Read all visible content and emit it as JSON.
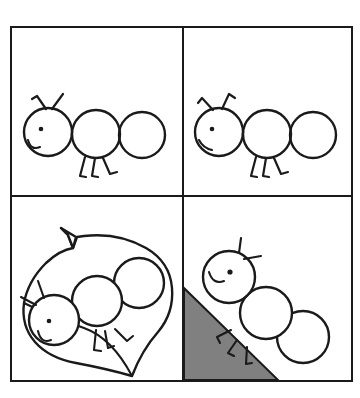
{
  "artwork": {
    "title": "Caterpillar Four-Panel Line Drawing",
    "subject": "caterpillar",
    "style": "black-and-white line art",
    "panel_count": 4,
    "background_color": "#ffffff",
    "line_color": "#1a1a1a",
    "accent_gray": "#808080",
    "frame": {
      "x": 11,
      "y": 27,
      "width": 341,
      "height": 354,
      "stroke_width": 2,
      "divider_x": 183,
      "divider_y": 196
    }
  },
  "panels": [
    {
      "id": "panel-top-left",
      "position": "top-left",
      "label": "Caterpillar smiling",
      "caterpillar": {
        "segments": 3,
        "mouth": "smile",
        "antennae": 2,
        "legs": 2,
        "eye": "dot",
        "orientation": "horizontal"
      },
      "props": []
    },
    {
      "id": "panel-top-right",
      "position": "top-right",
      "label": "Caterpillar with straight mouth",
      "caterpillar": {
        "segments": 3,
        "mouth": "straight-line",
        "antennae": 2,
        "legs": 2,
        "eye": "dot",
        "orientation": "horizontal"
      },
      "props": []
    },
    {
      "id": "panel-bottom-left",
      "position": "bottom-left",
      "label": "Caterpillar on a leaf",
      "caterpillar": {
        "segments": 3,
        "mouth": "smile",
        "antennae": 2,
        "legs": 2,
        "eye": "dot",
        "orientation": "tilted-diagonal"
      },
      "props": [
        "leaf-with-stem"
      ]
    },
    {
      "id": "panel-bottom-right",
      "position": "bottom-right",
      "label": "Caterpillar climbing a gray slope",
      "caterpillar": {
        "segments": 3,
        "mouth": "smile",
        "antennae": 2,
        "legs": 2,
        "eye": "dot",
        "orientation": "climbing-uphill"
      },
      "props": [
        "gray-triangle-hill"
      ]
    }
  ]
}
